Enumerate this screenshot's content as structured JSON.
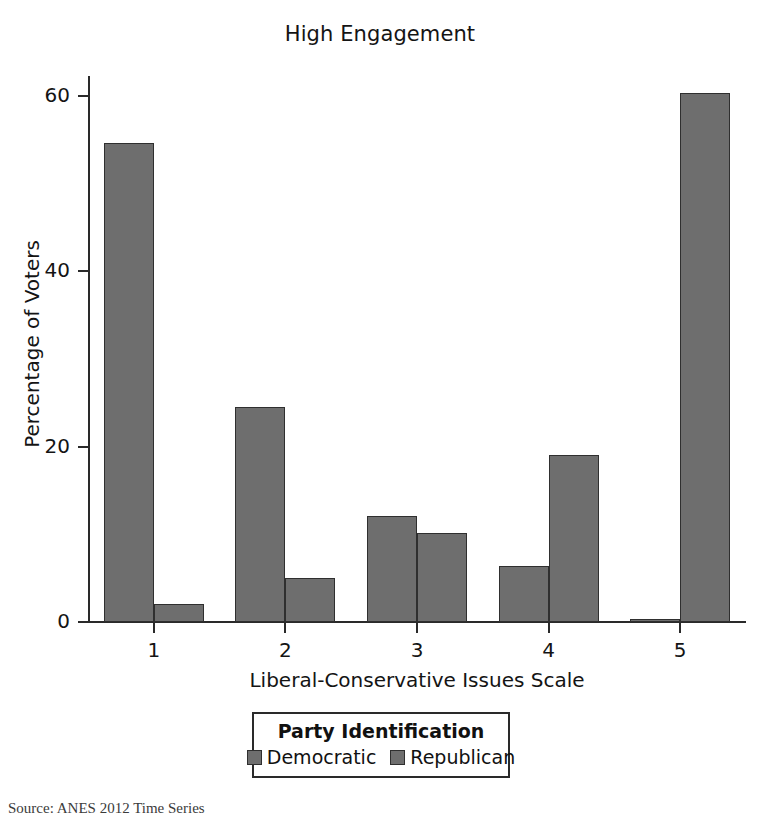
{
  "chart_data": {
    "type": "bar",
    "title": "High Engagement",
    "xlabel": "Liberal-Conservative Issues Scale",
    "ylabel": "Percentage of Voters",
    "categories": [
      "1",
      "2",
      "3",
      "4",
      "5"
    ],
    "series": [
      {
        "name": "Democratic",
        "values": [
          54.6,
          24.5,
          12.1,
          6.4,
          0.3
        ],
        "color": "#6e6e6e"
      },
      {
        "name": "Republican",
        "values": [
          2.1,
          5.0,
          10.1,
          19.1,
          60.3
        ],
        "color": "#6e6e6e"
      }
    ],
    "ylim": [
      0,
      63
    ],
    "y_ticks": [
      0,
      20,
      40,
      60
    ],
    "y_tick_labels": [
      "0",
      "20",
      "40",
      "60"
    ],
    "x_tick_labels": [
      "1",
      "2",
      "3",
      "4",
      "5"
    ],
    "grid": false,
    "legend_position": "bottom",
    "legend_title": "Party Identification"
  },
  "legend": {
    "title": "Party Identification",
    "entries": [
      {
        "label": "Democratic"
      },
      {
        "label": "Republican"
      }
    ]
  },
  "axes": {
    "y_title": "Percentage of Voters",
    "x_title": "Liberal-Conservative Issues Scale",
    "y_tick_labels": [
      "60",
      "40",
      "20",
      "0"
    ],
    "x_tick_labels": [
      "1",
      "2",
      "3",
      "4",
      "5"
    ]
  },
  "source_note": "Source: ANES 2012 Time Series"
}
